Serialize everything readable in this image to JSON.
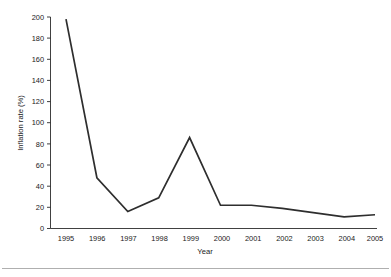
{
  "chart_data": {
    "type": "line",
    "title": "",
    "subtitle": "",
    "xlabel": "Year",
    "ylabel": "Inflation rate (%)",
    "categories": [
      "1995",
      "1996",
      "1997",
      "1998",
      "1999",
      "2000",
      "2001",
      "2002",
      "2003",
      "2004",
      "2005"
    ],
    "x": [
      1995,
      1996,
      1997,
      1998,
      1999,
      2000,
      2001,
      2002,
      2003,
      2004,
      2005
    ],
    "values": [
      198,
      48,
      16,
      29,
      86,
      22,
      22,
      19,
      15,
      11,
      13
    ],
    "series": [
      {
        "name": "Inflation rate (%)",
        "values": [
          198,
          48,
          16,
          29,
          86,
          22,
          22,
          19,
          15,
          11,
          13
        ]
      }
    ],
    "xlim": [
      1995,
      2005
    ],
    "ylim": [
      0,
      200
    ],
    "y_ticks": [
      0,
      20,
      40,
      60,
      80,
      100,
      120,
      140,
      160,
      180,
      200
    ],
    "y_tick_labels": [
      "0",
      "20",
      "40",
      "60",
      "80",
      "100",
      "120",
      "140",
      "160",
      "180",
      "200"
    ],
    "x_tick_labels": [
      "1995",
      "1996",
      "1997",
      "1998",
      "1999",
      "2000",
      "2001",
      "2002",
      "2003",
      "2004",
      "2005"
    ],
    "grid": false,
    "legend": false,
    "legend_position": "none",
    "line_color": "#2e2e2e",
    "background_color": "#ffffff",
    "markers": false,
    "annotations": []
  },
  "figure": {
    "y_axis_title": "Inflation rate (%)",
    "x_axis_title": "Year"
  }
}
